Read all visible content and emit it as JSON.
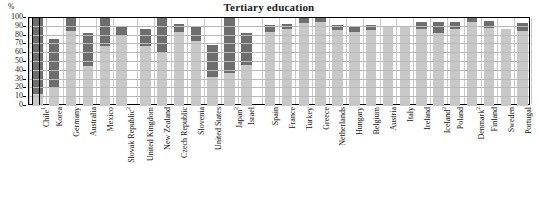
{
  "chart_data": {
    "type": "bar",
    "title": "Tertiary education",
    "subtype": "stacked-bar",
    "unit_label": "%",
    "xlabel": "",
    "ylabel": "%",
    "ylim": [
      0,
      100
    ],
    "yticks": [
      0,
      10,
      20,
      30,
      40,
      50,
      60,
      70,
      80,
      90,
      100
    ],
    "grid": true,
    "legend": "none",
    "categories": [
      "Chile¹",
      "Korea",
      "Germany",
      "Australia",
      "Mexico",
      "Slovak Republic²",
      "United Kingdom",
      "New Zealand",
      "Czech Republic",
      "Slovenia",
      "United States",
      "Japan²",
      "Israel",
      "Spain",
      "France",
      "Turkey",
      "Greece",
      "Netherlands",
      "Hungary",
      "Belgium",
      "Austria",
      "Italy",
      "Ireland",
      "Iceland²",
      "Poland",
      "Denmark²",
      "Finland",
      "Sweden",
      "Portugal"
    ],
    "series": [
      {
        "name": "lower-segment",
        "color": "#c8c8c8",
        "values": [
          14,
          20,
          85,
          46,
          68,
          81,
          68,
          60,
          84,
          74,
          33,
          38,
          47,
          84,
          88,
          94,
          95,
          86,
          84,
          86,
          90,
          91,
          87,
          83,
          87,
          95,
          89,
          88,
          85
        ]
      },
      {
        "name": "upper-segment",
        "color": "#6e6e6e",
        "values": [
          100,
          76,
          100,
          83,
          100,
          91,
          88,
          100,
          93,
          91,
          69,
          100,
          83,
          92,
          93,
          100,
          100,
          92,
          91,
          92,
          90,
          91,
          95,
          96,
          95,
          100,
          97,
          88,
          94
        ]
      }
    ],
    "group_breaks": [
      6,
      13
    ]
  },
  "footnotes": {
    "marker_1": "1",
    "marker_2": "2"
  }
}
